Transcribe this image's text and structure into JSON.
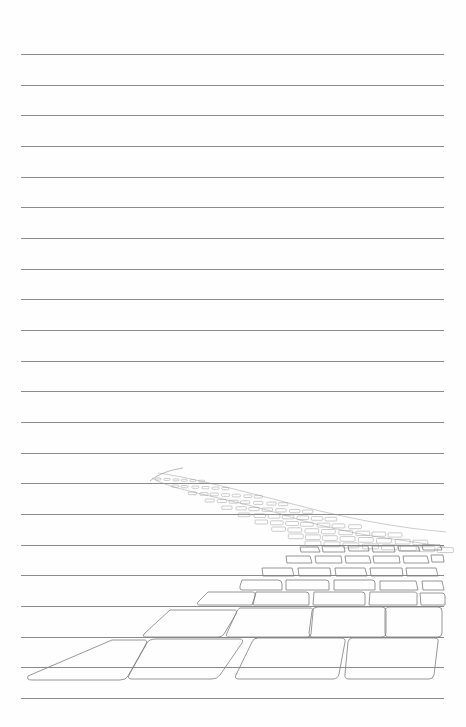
{
  "page": {
    "type": "lined writing paper",
    "background_color": "#fefefe",
    "rule_color": "#8a8a8a",
    "rule_count": 22,
    "rule_start_y": 54,
    "rule_spacing": 30.67,
    "rule_left_x": 21,
    "rule_right_x": 444
  },
  "illustration": {
    "subject": "sketched cobblestone brick road receding into distance",
    "stroke_color": "#7d7d7d",
    "position": "bottom right"
  }
}
